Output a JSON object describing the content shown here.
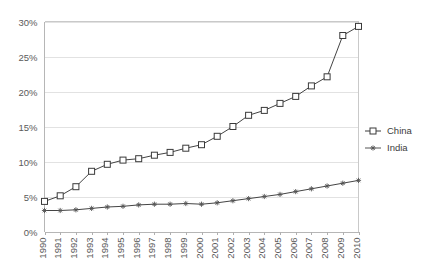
{
  "chart_data": {
    "type": "line",
    "title": "",
    "xlabel": "",
    "ylabel": "",
    "ylim": [
      0,
      30
    ],
    "ytick_labels": [
      "0%",
      "5%",
      "10%",
      "15%",
      "20%",
      "25%",
      "30%"
    ],
    "ytick_values": [
      0,
      5,
      10,
      15,
      20,
      25,
      30
    ],
    "grid": true,
    "legend_position": "right",
    "x": [
      1990,
      1991,
      1992,
      1993,
      1994,
      1995,
      1996,
      1997,
      1998,
      1999,
      2000,
      2001,
      2002,
      2003,
      2004,
      2005,
      2006,
      2007,
      2008,
      2009,
      2010
    ],
    "xtick_labels": [
      "1990",
      "1991",
      "1992",
      "1993",
      "1994",
      "1995",
      "1996",
      "1997",
      "1998",
      "1999",
      "2000",
      "2001",
      "2002",
      "2003",
      "2004",
      "2005",
      "2006",
      "2007",
      "2008",
      "2009",
      "2010"
    ],
    "series": [
      {
        "name": "China",
        "marker": "open-square",
        "color": "#3a3a3a",
        "values": [
          4.3,
          5.1,
          6.4,
          8.6,
          9.6,
          10.2,
          10.4,
          10.9,
          11.3,
          11.9,
          12.4,
          13.6,
          15.0,
          16.6,
          17.3,
          18.3,
          19.3,
          20.8,
          22.1,
          28.0,
          29.3
        ]
      },
      {
        "name": "India",
        "marker": "star",
        "color": "#555555",
        "values": [
          3.0,
          3.0,
          3.1,
          3.3,
          3.5,
          3.6,
          3.8,
          3.9,
          3.9,
          4.0,
          3.9,
          4.1,
          4.4,
          4.7,
          5.0,
          5.3,
          5.7,
          6.1,
          6.5,
          6.9,
          7.3
        ]
      }
    ]
  },
  "legend": {
    "items": [
      {
        "label": "China"
      },
      {
        "label": "India"
      }
    ]
  }
}
